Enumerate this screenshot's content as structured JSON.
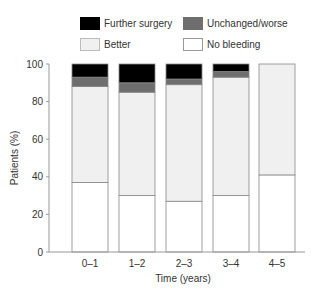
{
  "chart_data": {
    "type": "bar",
    "stacked": true,
    "title": "",
    "xlabel": "Time (years)",
    "ylabel": "Patients (%)",
    "ylim": [
      0,
      100
    ],
    "yticks": [
      0,
      20,
      40,
      60,
      80,
      100
    ],
    "grid": false,
    "legend_position": "top",
    "categories": [
      "0–1",
      "1–2",
      "2–3",
      "3–4",
      "4–5"
    ],
    "series": [
      {
        "name": "No bleeding",
        "color": "#ffffff",
        "values": [
          37,
          30,
          27,
          30,
          41
        ]
      },
      {
        "name": "Better",
        "color": "#f0f0f0",
        "values": [
          51,
          55,
          62,
          63,
          59
        ]
      },
      {
        "name": "Unchanged/worse",
        "color": "#6e6e6e",
        "values": [
          5,
          5,
          3,
          3,
          0
        ]
      },
      {
        "name": "Further surgery",
        "color": "#000000",
        "values": [
          7,
          10,
          8,
          4,
          0
        ]
      }
    ]
  },
  "legend": {
    "items": [
      {
        "label": "Further surgery",
        "color": "#000000"
      },
      {
        "label": "Unchanged/worse",
        "color": "#6e6e6e"
      },
      {
        "label": "Better",
        "color": "#f0f0f0"
      },
      {
        "label": "No bleeding",
        "color": "#ffffff"
      }
    ]
  }
}
